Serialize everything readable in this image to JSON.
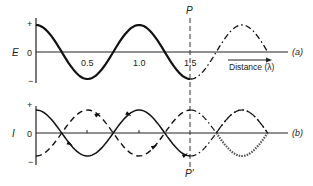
{
  "panel_a": {
    "y_label": "E",
    "y_ticks": [
      "+",
      "0",
      "−"
    ],
    "x_ticks": [
      "0.5",
      "1.0",
      "1.5"
    ],
    "x_tick_values": [
      0.5,
      1.0,
      1.5
    ],
    "tag": "(a)",
    "arrow_label": "Distance (λ)",
    "marker_label": "P"
  },
  "panel_b": {
    "y_label": "I",
    "y_ticks": [
      "+",
      "0",
      "−"
    ],
    "tag": "(b)",
    "marker_label": "P′"
  },
  "marker_position": 1.5,
  "curve_end": 2.25
}
